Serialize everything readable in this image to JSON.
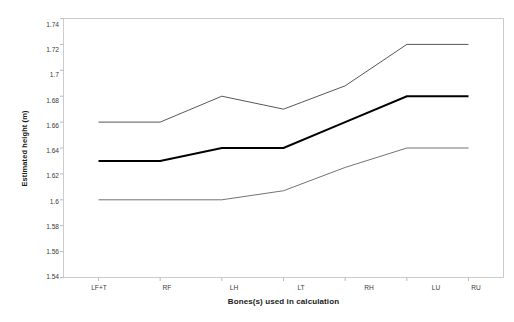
{
  "chart_data": {
    "type": "line",
    "title": "",
    "subtitle": "",
    "xlabel": "Bones(s) used in calculation",
    "ylabel": "Estimated height (m)",
    "categories": [
      "LF+T",
      "RF",
      "LH",
      "LT",
      "RH",
      "LU",
      "RU"
    ],
    "ylim": [
      1.54,
      1.74
    ],
    "ytick_step": 0.02,
    "ytick_labels": [
      "1.74",
      "1.72",
      "1.7",
      "1.68",
      "1.66",
      "1.64",
      "1.62",
      "1.6",
      "1.58",
      "1.56",
      "1.54"
    ],
    "ytick_values": [
      1.74,
      1.72,
      1.7,
      1.68,
      1.66,
      1.64,
      1.62,
      1.6,
      1.58,
      1.56,
      1.54
    ],
    "grid": false,
    "legend": "none",
    "series": [
      {
        "name": "upper bound",
        "style": "thin",
        "color": "#3a3a3a",
        "values": [
          1.66,
          1.66,
          1.68,
          1.67,
          1.688,
          1.72,
          1.72
        ]
      },
      {
        "name": "central estimate",
        "style": "bold",
        "color": "#000000",
        "values": [
          1.63,
          1.63,
          1.64,
          1.64,
          1.66,
          1.68,
          1.68
        ]
      },
      {
        "name": "lower bound",
        "style": "thin",
        "color": "#5a5a5a",
        "values": [
          1.6,
          1.6,
          1.6,
          1.607,
          1.625,
          1.64,
          1.64
        ]
      }
    ]
  },
  "axes": {
    "frame_color": "#cccccc",
    "tick_color": "#bbbbbb",
    "background": "#ffffff"
  }
}
